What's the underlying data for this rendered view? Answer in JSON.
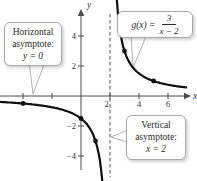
{
  "figure": {
    "callouts": {
      "horizontal_asymptote": {
        "line1": "Horizontal",
        "line2": "asymptote:",
        "math": "y = 0"
      },
      "vertical_asymptote": {
        "line1": "Vertical",
        "line2": "asymptote:",
        "math": "x = 2"
      },
      "function_label": {
        "lhs": "g(x) =",
        "numerator": "3",
        "denominator": "x − 2"
      }
    }
  },
  "chart_data": {
    "type": "line",
    "function": "g(x) = 3/(x − 2)",
    "curve": {
      "numerator": 3,
      "x_shift": 2
    },
    "vertical_asymptote_x": 2,
    "horizontal_asymptote_y": 0,
    "marked_points": [
      [
        -4,
        -0.5
      ],
      [
        0,
        -1.5
      ],
      [
        1,
        -3
      ],
      [
        3,
        3
      ],
      [
        5,
        1
      ]
    ],
    "x_ticks": [
      {
        "v": -4,
        "label": ""
      },
      {
        "v": -2,
        "label": ""
      },
      {
        "v": 2,
        "label": "2",
        "dx": -3.5
      },
      {
        "v": 4,
        "label": "4"
      },
      {
        "v": 6,
        "label": "6"
      }
    ],
    "y_ticks": [
      {
        "v": 4,
        "label": "4"
      },
      {
        "v": 2,
        "label": "2"
      },
      {
        "v": -2,
        "label": "−2"
      },
      {
        "v": -4,
        "label": "−4"
      }
    ],
    "axis_labels": {
      "x": "x",
      "y": "y"
    },
    "xlim": [
      -5.6,
      8
    ],
    "ylim": [
      -5.7,
      5.7
    ],
    "grid": false,
    "colors": {
      "curve": "#111111",
      "axis": "#4a4a4a",
      "dashed": "#555555",
      "text": "#333333"
    }
  }
}
